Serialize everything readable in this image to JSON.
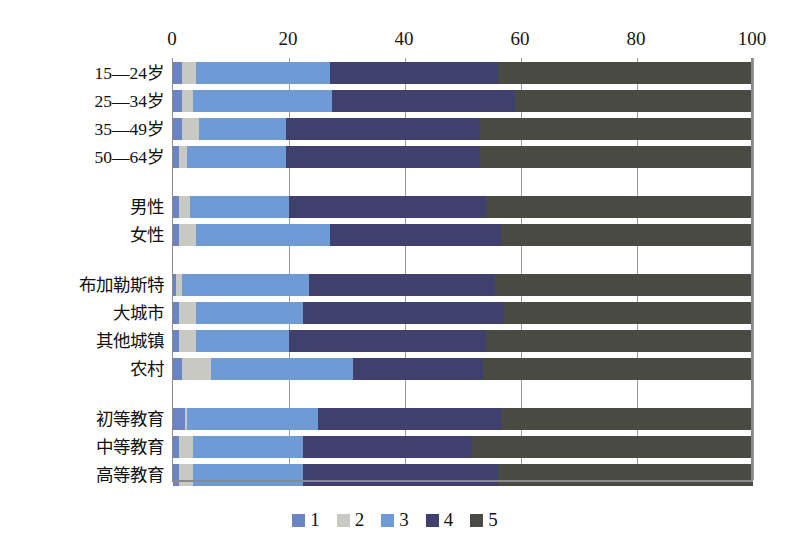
{
  "chart_data": {
    "type": "bar",
    "orientation": "horizontal",
    "stacked": true,
    "normalized_percent": true,
    "title": "",
    "subtitle": "",
    "xlabel": "",
    "ylabel": "",
    "xlim": [
      0,
      100
    ],
    "xticks": [
      0,
      20,
      40,
      60,
      80,
      100
    ],
    "xtick_labels": [
      "0",
      "20",
      "40",
      "60",
      "80",
      "100"
    ],
    "grid": true,
    "grid_axis": "x",
    "legend_position": "bottom-center",
    "axis_position": "top",
    "categories": [
      "15—24岁",
      "25—34岁",
      "35—49岁",
      "50—64岁",
      "男性",
      "女性",
      "布加勒斯特",
      "大城市",
      "其他城镇",
      "农村",
      "初等教育",
      "中等教育",
      "高等教育"
    ],
    "category_groups": [
      {
        "name": "age",
        "categories": [
          "15—24岁",
          "25—34岁",
          "35—49岁",
          "50—64岁"
        ]
      },
      {
        "name": "gender",
        "categories": [
          "男性",
          "女性"
        ]
      },
      {
        "name": "residence",
        "categories": [
          "布加勒斯特",
          "大城市",
          "其他城镇",
          "农村"
        ]
      },
      {
        "name": "education",
        "categories": [
          "初等教育",
          "中等教育",
          "高等教育"
        ]
      }
    ],
    "series": [
      {
        "name": "1",
        "color": "#6b84c4",
        "values": [
          1.5,
          1.5,
          1.5,
          1.0,
          1.0,
          1.0,
          0.5,
          1.0,
          1.0,
          1.5,
          2.0,
          1.0,
          1.0
        ]
      },
      {
        "name": "2",
        "color": "#c9c9c4",
        "values": [
          2.5,
          2.0,
          3.0,
          1.5,
          2.0,
          3.0,
          1.0,
          3.0,
          3.0,
          5.0,
          0.5,
          2.5,
          2.5
        ]
      },
      {
        "name": "3",
        "color": "#6e9bd5",
        "values": [
          23.0,
          24.0,
          15.0,
          17.0,
          17.0,
          23.0,
          22.0,
          18.5,
          16.0,
          24.5,
          22.5,
          19.0,
          19.0
        ]
      },
      {
        "name": "4",
        "color": "#40406e",
        "values": [
          29.0,
          31.5,
          33.5,
          33.5,
          34.0,
          29.5,
          32.0,
          34.5,
          34.0,
          22.5,
          31.5,
          29.0,
          33.5
        ]
      },
      {
        "name": "5",
        "color": "#4a4a45",
        "values": [
          44.0,
          41.0,
          47.0,
          47.0,
          46.0,
          43.5,
          44.5,
          43.0,
          46.0,
          46.5,
          43.5,
          48.5,
          44.0
        ]
      }
    ],
    "legend_entries": [
      {
        "label": "1",
        "color": "#6b84c4"
      },
      {
        "label": "2",
        "color": "#c9c9c4"
      },
      {
        "label": "3",
        "color": "#6e9bd5"
      },
      {
        "label": "4",
        "color": "#40406e"
      },
      {
        "label": "5",
        "color": "#4a4a45"
      }
    ]
  },
  "colors": {
    "background": "#ffffff",
    "axis_line": "#8a8a8a",
    "gridline": "#9b9b9b",
    "text": "#141414",
    "series_1": "#6b84c4",
    "series_2": "#c9c9c4",
    "series_3": "#6e9bd5",
    "series_4": "#40406e",
    "series_5": "#4a4a45"
  }
}
